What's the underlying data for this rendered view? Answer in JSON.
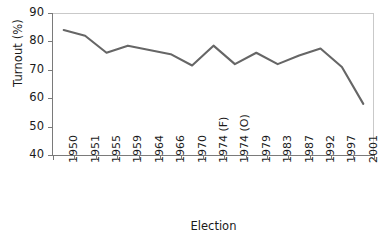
{
  "chart_data": {
    "type": "line",
    "title": "",
    "xlabel": "Election",
    "ylabel": "Turnout (%)",
    "categories": [
      "1950",
      "1951",
      "1955",
      "1959",
      "1964",
      "1966",
      "1970",
      "1974 (F)",
      "1974 (O)",
      "1979",
      "1983",
      "1987",
      "1992",
      "1997",
      "2001"
    ],
    "values": [
      84,
      82,
      76,
      78.5,
      77,
      75.5,
      71.5,
      78.5,
      72,
      76,
      72,
      75,
      77.5,
      71,
      58
    ],
    "series": [
      {
        "name": "Turnout",
        "values": [
          84,
          82,
          76,
          78.5,
          77,
          75.5,
          71.5,
          78.5,
          72,
          76,
          72,
          75,
          77.5,
          71,
          58
        ]
      }
    ],
    "ylim": [
      40,
      90
    ],
    "yticks": [
      40,
      50,
      60,
      70,
      80,
      90
    ],
    "ytick_labels": [
      "40",
      "50",
      "60",
      "70",
      "80",
      "90"
    ],
    "grid": false,
    "legend": "none",
    "line_color": "#666666",
    "axis_color": "#7a7a7a",
    "background_color": "#ffffff"
  }
}
